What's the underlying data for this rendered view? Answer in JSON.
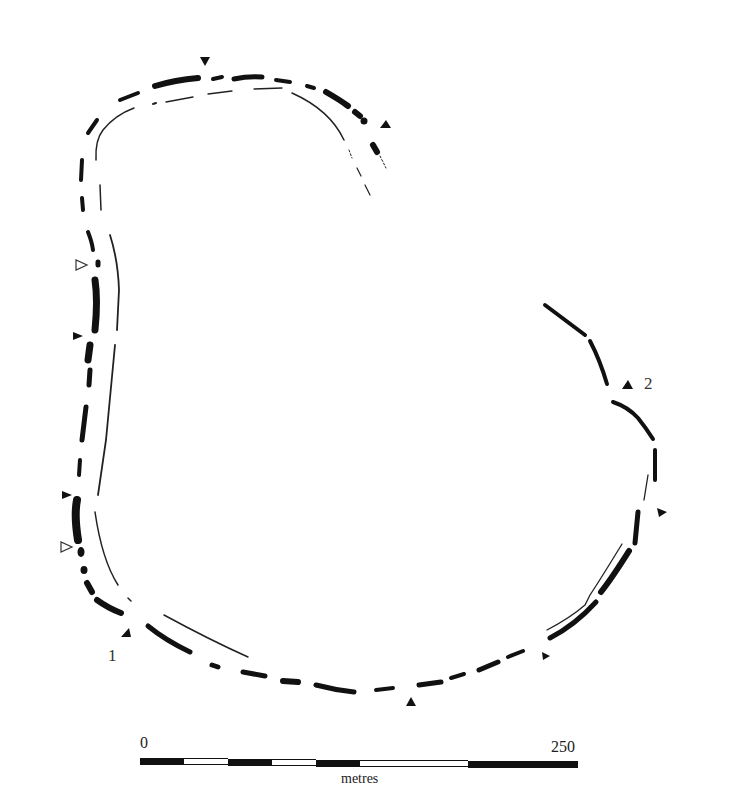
{
  "figure": {
    "type": "archaeological site plan",
    "labels": [
      {
        "id": "entrance-1",
        "text": "1"
      },
      {
        "id": "entrance-2",
        "text": "2"
      }
    ],
    "markers": {
      "filled_triangles": 9,
      "hollow_triangles": 2
    },
    "scale_bar": {
      "start_label": "0",
      "end_label": "250",
      "unit": "metres",
      "segments": [
        "black",
        "white",
        "black",
        "white",
        "black",
        "white",
        "black"
      ]
    },
    "colors": {
      "ink": "#111111",
      "background": "#ffffff"
    }
  }
}
